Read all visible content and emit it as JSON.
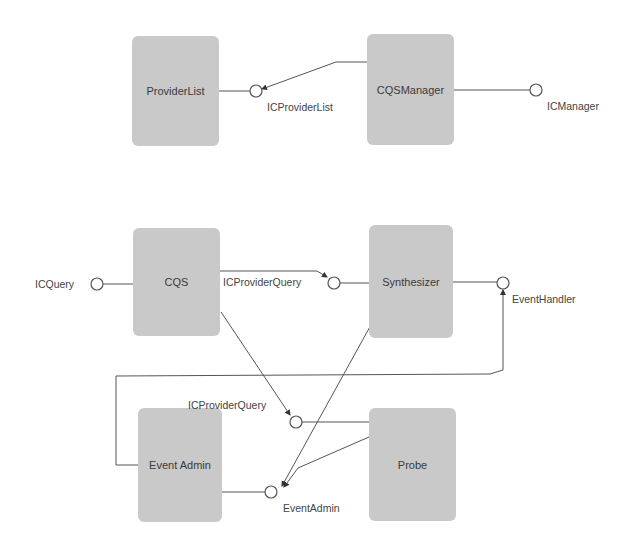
{
  "diagram": {
    "type": "UML component diagram",
    "components": [
      {
        "id": "providerlist",
        "label": "ProviderList"
      },
      {
        "id": "cqsmanager",
        "label": "CQSManager"
      },
      {
        "id": "cqs",
        "label": "CQS"
      },
      {
        "id": "synthesizer",
        "label": "Synthesizer"
      },
      {
        "id": "eventadmin",
        "label": "Event Admin"
      },
      {
        "id": "probe",
        "label": "Probe"
      }
    ],
    "interfaces": [
      {
        "id": "icproviderlist",
        "label": "ICProviderList",
        "provided_by": "ProviderList",
        "required_by": [
          "CQSManager"
        ]
      },
      {
        "id": "icmanager",
        "label": "ICManager",
        "provided_by": "CQSManager",
        "required_by": []
      },
      {
        "id": "icquery",
        "label": "ICQuery",
        "provided_by": "CQS",
        "required_by": []
      },
      {
        "id": "icproviderquery_synth",
        "label": "ICProviderQuery",
        "provided_by": "Synthesizer",
        "required_by": [
          "CQS"
        ]
      },
      {
        "id": "eventhandler",
        "label": "EventHandler",
        "provided_by": "Synthesizer",
        "required_by": [
          "Event Admin"
        ]
      },
      {
        "id": "icproviderquery_probe",
        "label": "ICProviderQuery",
        "provided_by": "Probe",
        "required_by": [
          "CQS"
        ]
      },
      {
        "id": "eventadmin_if",
        "label": "EventAdmin",
        "provided_by": "Event Admin",
        "required_by": [
          "Synthesizer",
          "Probe"
        ]
      }
    ],
    "colors": {
      "component_fill": "#c9c9c9",
      "line": "#555555",
      "background": "#ffffff"
    }
  }
}
